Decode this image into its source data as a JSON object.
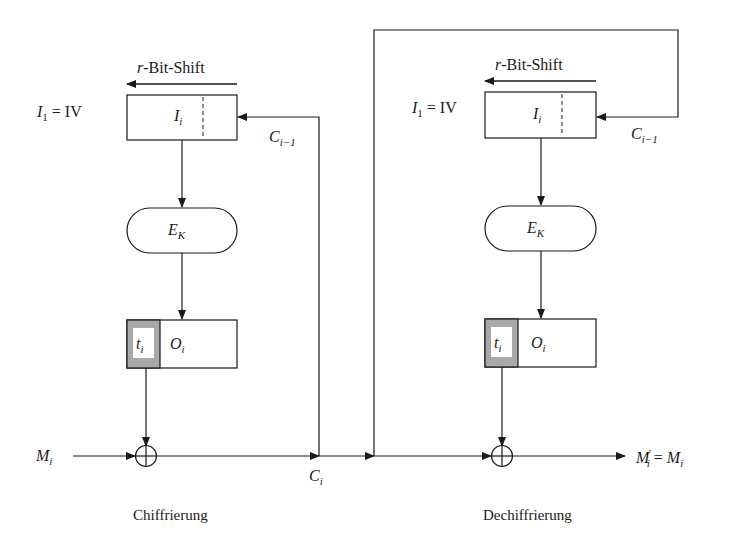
{
  "diagram": {
    "type": "block-diagram",
    "encryption": {
      "caption": "Chiffrierung",
      "shift_label_var": "r",
      "shift_label_text": "-Bit-Shift",
      "init_label": {
        "var": "I",
        "sub": "1",
        "eq": " = IV"
      },
      "register_label": {
        "var": "I",
        "sub": "i"
      },
      "feedback_label": {
        "var": "C",
        "sub": "i−1"
      },
      "cipher_label": {
        "var": "E",
        "sub": "K"
      },
      "output_t": {
        "var": "t",
        "sub": "i"
      },
      "output_o": {
        "var": "O",
        "sub": "i"
      },
      "input_label": {
        "var": "M",
        "sub": "i"
      },
      "output_label": {
        "var": "C",
        "sub": "i"
      }
    },
    "decryption": {
      "caption": "Dechiffrierung",
      "shift_label_var": "r",
      "shift_label_text": "-Bit-Shift",
      "init_label": {
        "var": "I",
        "sub": "1",
        "eq": " = IV"
      },
      "register_label": {
        "var": "I",
        "sub": "i"
      },
      "feedback_label": {
        "var": "C",
        "sub": "i−1"
      },
      "cipher_label": {
        "var": "E",
        "sub": "K"
      },
      "output_t": {
        "var": "t",
        "sub": "i"
      },
      "output_o": {
        "var": "O",
        "sub": "i"
      },
      "output_label": {
        "var": "M",
        "prime": "′",
        "sub": "i",
        "eq": " = ",
        "var2": "M",
        "sub2": "i"
      }
    },
    "colors": {
      "line": "#1a1a1a",
      "shade": "#a8a8a8",
      "background": "#ffffff"
    }
  }
}
